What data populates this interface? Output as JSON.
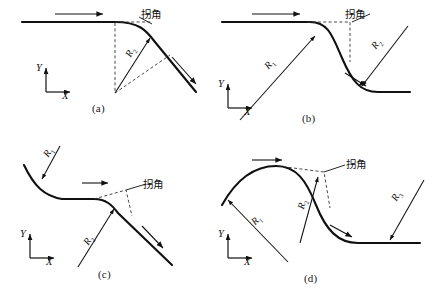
{
  "figure": {
    "type": "technical-line-diagram",
    "stroke_color": "#111111",
    "dash_color": "#333333"
  },
  "labels": {
    "corner": "拐角",
    "axis_x": "X",
    "axis_y": "Y",
    "r1": "R",
    "r1_sub": "1",
    "r2": "R",
    "r2_sub": "2",
    "r3": "R",
    "r3_sub": "3"
  },
  "panels": [
    {
      "id": "a",
      "caption": "(a)",
      "corner_label": "拐角",
      "radii": [
        "R2"
      ],
      "axes": {
        "x": "X",
        "y": "Y"
      },
      "arrows": 2
    },
    {
      "id": "b",
      "caption": "(b)",
      "corner_label": "拐角",
      "radii": [
        "R1",
        "R2"
      ],
      "axes": {
        "x": "X",
        "y": "Y"
      },
      "arrows": 2
    },
    {
      "id": "c",
      "caption": "(c)",
      "corner_label": "拐角",
      "radii": [
        "R1",
        "R2"
      ],
      "axes": {
        "x": "X",
        "y": "Y"
      },
      "arrows": 2
    },
    {
      "id": "d",
      "caption": "(d)",
      "corner_label": "拐角",
      "radii": [
        "R1",
        "R2",
        "R3"
      ],
      "axes": {
        "x": "X",
        "y": "Y"
      },
      "arrows": 2
    }
  ]
}
